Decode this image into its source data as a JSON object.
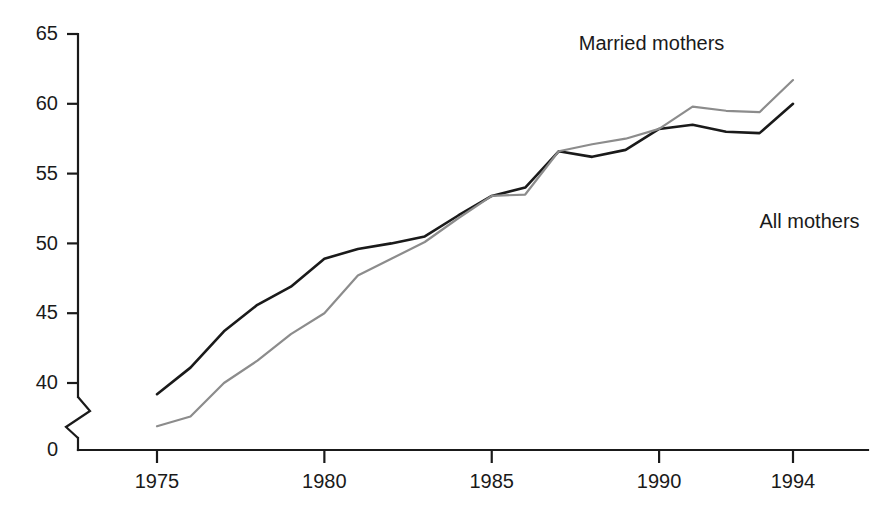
{
  "chart_data": {
    "type": "line",
    "title": "",
    "subtitle": "",
    "xlabel": "",
    "ylabel": "",
    "x": [
      1975,
      1976,
      1977,
      1978,
      1979,
      1980,
      1981,
      1982,
      1983,
      1984,
      1985,
      1986,
      1987,
      1988,
      1989,
      1990,
      1991,
      1992,
      1993,
      1994
    ],
    "xlim": [
      1974,
      1995
    ],
    "ylim": [
      0,
      65
    ],
    "y_axis_break": {
      "present": true,
      "from": 0,
      "to": 37,
      "symbol": "zigzag"
    },
    "yticks": [
      0,
      40,
      45,
      50,
      55,
      60,
      65
    ],
    "ytick_labels": [
      "0",
      "40",
      "45",
      "50",
      "55",
      "60",
      "65"
    ],
    "xticks": [
      1975,
      1980,
      1985,
      1990,
      1994
    ],
    "xtick_labels": [
      "1975",
      "1980",
      "1985",
      "1990",
      "1994"
    ],
    "grid": false,
    "legend_position": "inline-annotation",
    "series": [
      {
        "name": "All mothers",
        "color": "#1a1a1a",
        "linewidth": 2.6,
        "label_x": 1993.0,
        "label_y": 51.5,
        "values": [
          39.2,
          41.1,
          43.7,
          45.6,
          46.9,
          48.9,
          49.6,
          50.0,
          50.5,
          52.0,
          53.4,
          54.0,
          56.6,
          56.2,
          56.7,
          58.2,
          58.5,
          58.0,
          57.9,
          60.0
        ]
      },
      {
        "name": "Married mothers",
        "color": "#8c8c8c",
        "linewidth": 2.2,
        "label_x": 1987.6,
        "label_y": 64.2,
        "values": [
          36.9,
          37.6,
          40.0,
          41.6,
          43.5,
          45.0,
          47.7,
          48.9,
          50.1,
          51.8,
          53.4,
          53.5,
          56.6,
          57.1,
          57.5,
          58.2,
          59.8,
          59.5,
          59.4,
          61.7
        ]
      }
    ]
  },
  "annotations": {
    "married_label": "Married mothers",
    "all_label": "All mothers"
  }
}
